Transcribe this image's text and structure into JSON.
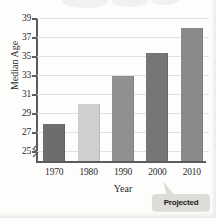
{
  "chart_data": {
    "type": "bar",
    "title": "",
    "subtitle": "",
    "xlabel": "Year",
    "ylabel": "Median Age",
    "categories": [
      "1970",
      "1980",
      "1990",
      "2000",
      "2010"
    ],
    "values": [
      27.9,
      30.0,
      32.9,
      35.3,
      38.0
    ],
    "series": [
      {
        "name": "Median Age",
        "values": [
          27.9,
          30.0,
          32.9,
          35.3,
          38.0
        ]
      }
    ],
    "ylim": [
      24,
      39
    ],
    "yticks": [
      25,
      27,
      29,
      31,
      33,
      35,
      37,
      39
    ],
    "ytick_labels": [
      "25",
      "27",
      "29",
      "31",
      "33",
      "35",
      "37",
      "39"
    ],
    "xtick_labels": [
      "1970",
      "1980",
      "1990",
      "2000",
      "2010"
    ],
    "grid": true,
    "grid_axis": "y",
    "legend": false,
    "legend_position": "none",
    "axis_break": true,
    "axis_break_note": "zigzag break on y-axis below 25",
    "annotations": [
      {
        "text": "Projected",
        "kind": "callout",
        "points_to_category": "2010"
      }
    ],
    "bar_colors": [
      "#6d6d6d",
      "#cfcfcf",
      "#909090",
      "#767676",
      "#8a8a8a"
    ],
    "background_color": "#fdfdfc",
    "axis_color": "#5c5c5c",
    "gridline_color": "#e2e2e0",
    "text_color": "#2b2b2b"
  },
  "annotation": {
    "projected_label": "Projected"
  }
}
